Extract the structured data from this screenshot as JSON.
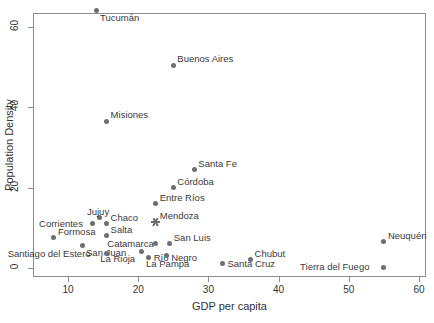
{
  "chart_data": {
    "type": "scatter",
    "title": "",
    "xlabel": "GDP per capita",
    "ylabel": "Population Density",
    "xlim": [
      6.5,
      61.0
    ],
    "ylim": [
      -1.5,
      66.5
    ],
    "xticks": [
      10,
      20,
      30,
      40,
      50,
      60
    ],
    "yticks": [
      0,
      20,
      40,
      60
    ],
    "xtick_labels": [
      "10",
      "20",
      "30",
      "40",
      "50",
      "60"
    ],
    "ytick_labels": [
      "0",
      "20",
      "40",
      "60"
    ],
    "grid": false,
    "legend": "none",
    "marker_color": "#6e6e72",
    "frame_color": "#8c8c8c",
    "points": [
      {
        "label": "Tucumán",
        "x": 14.0,
        "y": 64.0,
        "marker": "circle",
        "label_pos": "below-right"
      },
      {
        "label": "Buenos Aires",
        "x": 25.0,
        "y": 50.5,
        "marker": "circle",
        "label_pos": "above-right"
      },
      {
        "label": "Misiones",
        "x": 15.5,
        "y": 36.5,
        "marker": "circle",
        "label_pos": "above-right"
      },
      {
        "label": "Santa Fe",
        "x": 28.0,
        "y": 24.5,
        "marker": "circle",
        "label_pos": "above-right"
      },
      {
        "label": "Córdoba",
        "x": 25.0,
        "y": 20.0,
        "marker": "circle",
        "label_pos": "above-right"
      },
      {
        "label": "Entre Ríos",
        "x": 22.5,
        "y": 16.0,
        "marker": "circle",
        "label_pos": "above-right"
      },
      {
        "label": "Mendoza",
        "x": 22.5,
        "y": 11.5,
        "marker": "star",
        "label_pos": "above-right"
      },
      {
        "label": "Jujuy",
        "x": 14.5,
        "y": 12.5,
        "marker": "circle",
        "label_pos": "above"
      },
      {
        "label": "Chaco",
        "x": 15.5,
        "y": 11.0,
        "marker": "circle",
        "label_pos": "above-right"
      },
      {
        "label": "Corrientes",
        "x": 13.5,
        "y": 11.0,
        "marker": "circle",
        "label_pos": "left"
      },
      {
        "label": "Salta",
        "x": 15.5,
        "y": 8.0,
        "marker": "circle",
        "label_pos": "above-right"
      },
      {
        "label": "Formosa",
        "x": 8.0,
        "y": 7.5,
        "marker": "circle",
        "label_pos": "above-right"
      },
      {
        "label": "Neuquén",
        "x": 55.0,
        "y": 6.5,
        "marker": "circle",
        "label_pos": "above-right"
      },
      {
        "label": "San Luis",
        "x": 24.5,
        "y": 6.0,
        "marker": "circle",
        "label_pos": "above-right"
      },
      {
        "label": "Catamarca",
        "x": 22.5,
        "y": 6.0,
        "marker": "circle",
        "label_pos": "left"
      },
      {
        "label": "San Juan",
        "x": 12.0,
        "y": 5.5,
        "marker": "circle",
        "label_pos": "below-right"
      },
      {
        "label": "Santiago del Estero",
        "x": 15.5,
        "y": 3.5,
        "marker": "circle",
        "label_pos": "left"
      },
      {
        "label": "La Rioja",
        "x": 20.5,
        "y": 4.0,
        "marker": "circle",
        "label_pos": "below-left"
      },
      {
        "label": "Río Negro",
        "x": 21.5,
        "y": 2.5,
        "marker": "circle",
        "label_pos": "right"
      },
      {
        "label": "La Pampa",
        "x": 24.0,
        "y": 3.0,
        "marker": "circle",
        "label_pos": "below"
      },
      {
        "label": "Chubut",
        "x": 36.0,
        "y": 2.0,
        "marker": "circle",
        "label_pos": "above-right"
      },
      {
        "label": "Santa Cruz",
        "x": 32.0,
        "y": 1.0,
        "marker": "circle",
        "label_pos": "right"
      },
      {
        "label": "Tierra del Fuego",
        "x": 55.0,
        "y": 0.2,
        "marker": "circle",
        "label_pos": "left"
      }
    ]
  }
}
